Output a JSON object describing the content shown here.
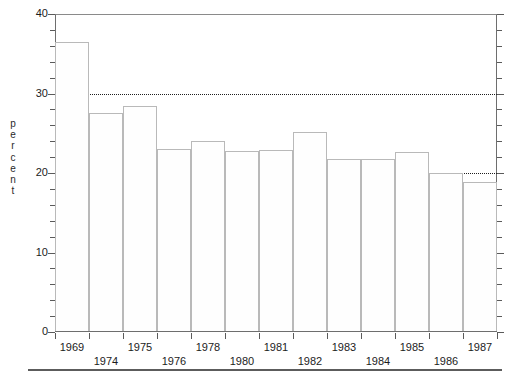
{
  "chart_data": {
    "type": "bar",
    "title": "",
    "subtitle": "",
    "xlabel": "",
    "ylabel": "percent",
    "categories": [
      "1969",
      "1974",
      "1975",
      "1976",
      "1978",
      "1980",
      "1981",
      "1982",
      "1983",
      "1984",
      "1985",
      "1986",
      "1987"
    ],
    "values": [
      36.5,
      27.5,
      28.4,
      23.0,
      24.0,
      22.8,
      22.9,
      25.1,
      21.7,
      21.7,
      22.7,
      20.0,
      18.9
    ],
    "ylim": [
      0,
      40
    ],
    "y_major_ticks": [
      0,
      10,
      20,
      30,
      40
    ],
    "y_major_tick_labels": [
      "0",
      "10",
      "20",
      "30",
      "40"
    ],
    "y_minor_tick_interval": 2,
    "gridlines_y": [
      10,
      20,
      30
    ],
    "grid": "horizontal-dotted",
    "legend": "none",
    "legend_entries": [],
    "bar_fill_color": "#fefefe",
    "bar_edge_color": "#b9b9b9",
    "gridline_color": "#1f1f1f",
    "axis_color": "#6e6e6e",
    "background_color": "#ffffff",
    "annotations": []
  },
  "axes": {
    "y_label_text": "percent",
    "y_label_chars": [
      "p",
      "e",
      "r",
      "c",
      "e",
      "n",
      "t"
    ],
    "x_label_rows": [
      {
        "row": 0,
        "labels": [
          "1969",
          "1975",
          "1978",
          "1981",
          "1983",
          "1985",
          "1987"
        ]
      },
      {
        "row": 1,
        "labels": [
          "1974",
          "1976",
          "1980",
          "1982",
          "1984",
          "1986"
        ]
      }
    ]
  },
  "xticks": [
    {
      "label": "1969",
      "row": 0
    },
    {
      "label": "1974",
      "row": 1
    },
    {
      "label": "1975",
      "row": 0
    },
    {
      "label": "1976",
      "row": 1
    },
    {
      "label": "1978",
      "row": 0
    },
    {
      "label": "1980",
      "row": 1
    },
    {
      "label": "1981",
      "row": 0
    },
    {
      "label": "1982",
      "row": 1
    },
    {
      "label": "1983",
      "row": 0
    },
    {
      "label": "1984",
      "row": 1
    },
    {
      "label": "1985",
      "row": 0
    },
    {
      "label": "1986",
      "row": 1
    },
    {
      "label": "1987",
      "row": 0
    }
  ],
  "yticks": [
    {
      "value": 0,
      "label": "0"
    },
    {
      "value": 10,
      "label": "10"
    },
    {
      "value": 20,
      "label": "20"
    },
    {
      "value": 30,
      "label": "30"
    },
    {
      "value": 40,
      "label": "40"
    }
  ]
}
